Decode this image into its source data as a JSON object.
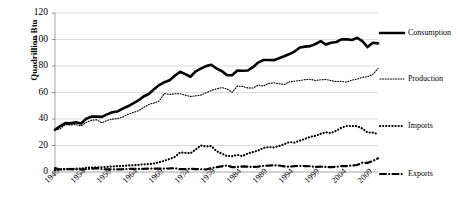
{
  "chart_data": {
    "type": "line",
    "title": "",
    "xlabel": "",
    "ylabel": "Quadrillion Btu",
    "ylim": [
      0,
      120
    ],
    "xlim": [
      1949,
      2011
    ],
    "grid": true,
    "legend_position": "right",
    "yticks": [
      "0",
      "20",
      "40",
      "60",
      "80",
      "100",
      "120"
    ],
    "ytick_values": [
      0,
      20,
      40,
      60,
      80,
      100,
      120
    ],
    "xticks": [
      "1949",
      "1954",
      "1959",
      "1964",
      "1969",
      "1974",
      "1979",
      "1984",
      "1989",
      "1994",
      "1999",
      "2004",
      "2009"
    ],
    "xtick_values": [
      1949,
      1954,
      1959,
      1964,
      1969,
      1974,
      1979,
      1984,
      1989,
      1994,
      1999,
      2004,
      2009
    ],
    "x": [
      1949,
      1950,
      1951,
      1952,
      1953,
      1954,
      1955,
      1956,
      1957,
      1958,
      1959,
      1960,
      1961,
      1962,
      1963,
      1964,
      1965,
      1966,
      1967,
      1968,
      1969,
      1970,
      1971,
      1972,
      1973,
      1974,
      1975,
      1976,
      1977,
      1978,
      1979,
      1980,
      1981,
      1982,
      1983,
      1984,
      1985,
      1986,
      1987,
      1988,
      1989,
      1990,
      1991,
      1992,
      1993,
      1994,
      1995,
      1996,
      1997,
      1998,
      1999,
      2000,
      2001,
      2002,
      2003,
      2004,
      2005,
      2006,
      2007,
      2008,
      2009,
      2010,
      2011
    ],
    "series": [
      {
        "name": "Consumption",
        "style": "thick-solid",
        "color": "#000000",
        "values": [
          31.9,
          34.6,
          36.9,
          36.7,
          37.6,
          36.6,
          40.2,
          41.8,
          41.8,
          41.6,
          43.5,
          45.1,
          45.7,
          47.8,
          49.6,
          51.8,
          54.0,
          57.0,
          58.9,
          62.4,
          65.6,
          67.8,
          69.3,
          72.7,
          75.7,
          73.9,
          71.9,
          76.0,
          78.0,
          79.9,
          80.9,
          78.1,
          76.2,
          73.1,
          73.0,
          76.6,
          76.4,
          76.6,
          79.1,
          82.6,
          84.5,
          84.5,
          84.4,
          85.8,
          87.4,
          89.0,
          91.0,
          94.0,
          94.6,
          95.0,
          96.6,
          98.7,
          96.2,
          97.6,
          98.1,
          100.1,
          100.2,
          99.6,
          101.2,
          98.8,
          94.3,
          97.6,
          97.1
        ]
      },
      {
        "name": "Production",
        "style": "fine-dotted",
        "color": "#000000",
        "values": [
          31.7,
          32.6,
          35.8,
          35.5,
          35.9,
          34.8,
          37.4,
          39.0,
          39.4,
          37.2,
          38.9,
          39.9,
          40.3,
          41.5,
          43.5,
          44.9,
          46.2,
          48.6,
          51.0,
          52.1,
          53.6,
          59.2,
          58.5,
          59.0,
          59.1,
          58.0,
          57.0,
          57.5,
          58.0,
          59.8,
          61.5,
          62.7,
          63.7,
          62.7,
          60.1,
          64.8,
          64.6,
          63.5,
          63.4,
          65.6,
          64.9,
          66.9,
          67.3,
          66.6,
          66.0,
          68.1,
          68.5,
          69.1,
          69.7,
          70.0,
          69.1,
          69.6,
          69.8,
          69.0,
          68.2,
          68.4,
          67.8,
          69.4,
          70.1,
          71.5,
          71.9,
          73.6,
          78.1
        ]
      },
      {
        "name": "Imports",
        "style": "bold-dotted",
        "color": "#000000",
        "values": [
          1.4,
          1.9,
          2.0,
          2.3,
          2.5,
          2.6,
          3.1,
          3.4,
          3.5,
          3.6,
          3.9,
          4.2,
          4.4,
          4.6,
          4.9,
          5.1,
          5.4,
          5.8,
          5.9,
          6.5,
          7.4,
          8.4,
          9.8,
          11.4,
          14.7,
          14.4,
          14.1,
          17.0,
          20.0,
          19.3,
          19.6,
          15.8,
          13.9,
          12.0,
          12.0,
          12.9,
          12.0,
          14.0,
          15.0,
          16.2,
          18.2,
          18.8,
          18.5,
          19.6,
          21.0,
          22.6,
          22.2,
          23.7,
          25.0,
          26.6,
          27.3,
          28.9,
          30.0,
          29.4,
          31.1,
          33.5,
          34.7,
          34.7,
          34.6,
          32.8,
          29.8,
          29.7,
          28.6
        ]
      },
      {
        "name": "Exports",
        "style": "dash-dot",
        "color": "#000000",
        "values": [
          2.9,
          1.9,
          2.2,
          2.2,
          1.9,
          1.9,
          2.1,
          2.5,
          2.9,
          2.2,
          2.0,
          2.0,
          2.0,
          2.1,
          2.3,
          2.4,
          2.3,
          2.3,
          2.6,
          2.5,
          2.5,
          2.6,
          2.7,
          2.9,
          2.1,
          2.2,
          2.4,
          2.2,
          2.1,
          1.9,
          2.9,
          3.7,
          4.3,
          4.9,
          3.7,
          3.8,
          4.2,
          4.0,
          3.8,
          4.0,
          4.6,
          4.8,
          5.0,
          4.9,
          4.2,
          4.0,
          4.5,
          4.6,
          4.5,
          4.3,
          3.8,
          4.0,
          3.8,
          3.7,
          4.0,
          4.4,
          4.5,
          4.9,
          5.3,
          7.0,
          6.9,
          8.3,
          10.3
        ]
      }
    ]
  },
  "legend": {
    "items": [
      {
        "label": "Consumption",
        "style": "thick-solid"
      },
      {
        "label": "Production",
        "style": "fine-dotted"
      },
      {
        "label": "Imports",
        "style": "bold-dotted"
      },
      {
        "label": "Exports",
        "style": "dash-dot"
      }
    ]
  },
  "axes": {
    "y_title": "Quadrillion Btu"
  }
}
